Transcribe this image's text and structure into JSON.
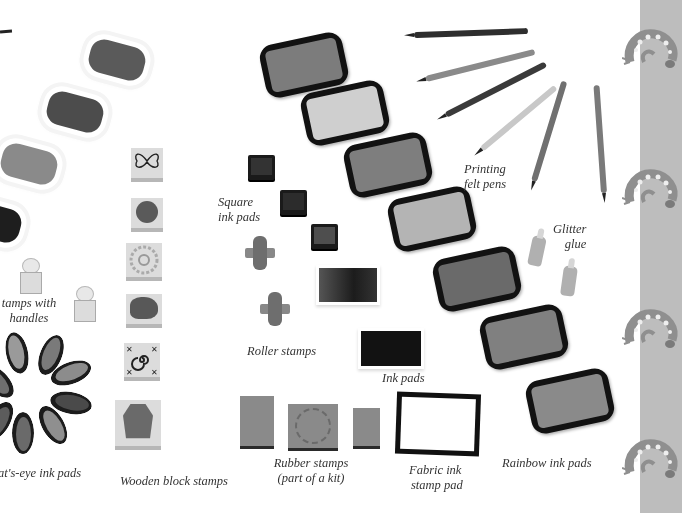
{
  "image": {
    "subject": "Stamping and printing craft supplies",
    "style": "grayscale catalogue photograph with italic captions"
  },
  "labels": {
    "stamps_with_handles": "Stamps with handles",
    "stamps_with_handles_visible": "tamps with",
    "stamps_with_handles_line2": "handles",
    "cats_eye": "Cat's-eye ink pads",
    "cats_eye_visible": "at's-eye ink pads",
    "wooden_block": "Wooden block stamps",
    "square_line1": "Square",
    "square_line2": "ink pads",
    "roller": "Roller stamps",
    "ink_pads": "Ink pads",
    "rubber_line1": "Rubber stamps",
    "rubber_line2": "(part of a kit)",
    "fabric_line1": "Fabric ink",
    "fabric_line2": "stamp pad",
    "rainbow": "Rainbow ink pads",
    "pens_line1": "Printing",
    "pens_line2": "felt pens",
    "glitter_line1": "Glitter",
    "glitter_line2": "glue"
  },
  "colors": {
    "background": "#ffffff",
    "side_strip": "#bdbdbd",
    "caption_text": "#333333"
  },
  "decorations": {
    "side_strip_icons": [
      "gecko-icon",
      "gecko-icon",
      "gecko-icon",
      "gecko-icon"
    ]
  }
}
